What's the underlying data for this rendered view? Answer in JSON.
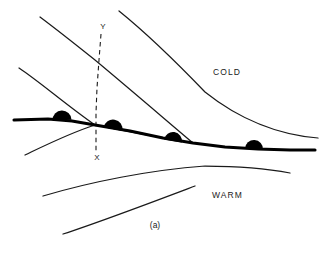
{
  "figure": {
    "caption": "(a)",
    "air_mass_labels": [
      {
        "name": "cold-air-label",
        "text": "COLD",
        "x": 213,
        "y": 75
      },
      {
        "name": "warm-air-label",
        "text": "WARM",
        "x": 212,
        "y": 198
      }
    ],
    "cross_section_line": {
      "name": "cross-section-xy",
      "top_label": "Y",
      "bottom_label": "X",
      "top_label_pos": {
        "x": 103,
        "y": 29
      },
      "bottom_label_pos": {
        "x": 97,
        "y": 160
      },
      "path": "M 101,34 L 99,60 L 97,88 L 96,113 L 96,133 L 96,152"
    },
    "occluded_front": {
      "name": "occluded-front-line",
      "path": "M 14,120 L 48,119 L 72,121 L 95,125 L 130,131 L 163,138 L 193,143 L 225,147 L 258,149 L 290,150 L 315,150",
      "semicircles": [
        {
          "name": "front-semicircle-1",
          "cx": 62,
          "cy": 119,
          "r": 9.5,
          "rot": -2
        },
        {
          "name": "front-semicircle-2",
          "cx": 113,
          "cy": 128,
          "r": 9.5,
          "rot": 10
        },
        {
          "name": "front-semicircle-3",
          "cx": 173,
          "cy": 140,
          "r": 9.0,
          "rot": 9
        },
        {
          "name": "front-semicircle-4",
          "cx": 254,
          "cy": 148,
          "r": 9.0,
          "rot": 3
        }
      ]
    },
    "thin_curves": [
      {
        "name": "upper-cold-front-curve",
        "path": "M 40,17 C 60,32 80,48 95,60 C 125,85 160,115 193,143"
      },
      {
        "name": "upper-warm-front-curve",
        "path": "M 119,11 C 150,36 180,66 205,92 C 240,120 280,135 318,138"
      },
      {
        "name": "left-upper-branch-curve",
        "path": "M 19,68 C 40,82 65,104 95,125"
      },
      {
        "name": "left-lower-branch-curve",
        "path": "M 25,155 C 48,144 70,133 95,125"
      },
      {
        "name": "lower-branch-to-triple-point",
        "path": "M 95,125 C 125,131 160,138 193,143"
      },
      {
        "name": "lower-warm-boundary-curve-upper",
        "path": "M 43,196 C 90,182 150,170 205,166 C 245,166 275,170 290,173"
      },
      {
        "name": "lower-warm-boundary-curve-lower",
        "path": "M 63,234 C 100,222 150,203 195,186"
      }
    ]
  }
}
